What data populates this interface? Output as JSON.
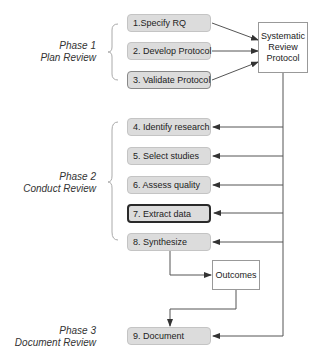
{
  "phases": [
    {
      "line1": "Phase 1",
      "line2": "Plan Review"
    },
    {
      "line1": "Phase 2",
      "line2": "Conduct Review"
    },
    {
      "line1": "Phase 3",
      "line2": "Document Review"
    }
  ],
  "steps": [
    {
      "label": "1.Specify RQ"
    },
    {
      "label": "2. Develop Protocol"
    },
    {
      "label": "3. Validate Protocol"
    },
    {
      "label": "4. Identify research"
    },
    {
      "label": "5. Select studies"
    },
    {
      "label": "6. Assess quality"
    },
    {
      "label": "7. Extract data",
      "highlighted": true
    },
    {
      "label": "8. Synthesize"
    },
    {
      "label": "9. Document"
    }
  ],
  "documents": {
    "protocol": {
      "line1": "Systematic",
      "line2": "Review",
      "line3": "Protocol"
    },
    "outcomes": {
      "label": "Outcomes"
    }
  },
  "colors": {
    "step_fill": "#dcdcdc",
    "line": "#555555",
    "brace": "#aaaaaa"
  }
}
